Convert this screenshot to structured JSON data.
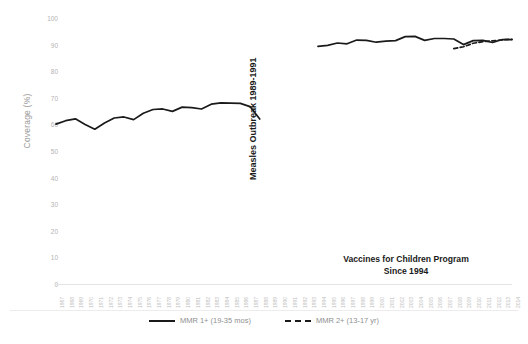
{
  "chart_data": {
    "type": "line",
    "title": "",
    "xlabel": "",
    "ylabel": "Coverage (%)",
    "ylim": [
      0,
      100
    ],
    "ytick_step": 10,
    "yticks": [
      0,
      10,
      20,
      30,
      40,
      50,
      60,
      70,
      80,
      90,
      100
    ],
    "grid": false,
    "legend_position": "bottom-center",
    "x": [
      1967,
      1968,
      1969,
      1970,
      1971,
      1972,
      1973,
      1974,
      1975,
      1976,
      1977,
      1978,
      1979,
      1980,
      1981,
      1982,
      1983,
      1984,
      1985,
      1986,
      1987,
      1988,
      1989,
      1990,
      1991,
      1992,
      1993,
      1994,
      1995,
      1996,
      1997,
      1998,
      1999,
      2000,
      2001,
      2002,
      2003,
      2004,
      2005,
      2006,
      2007,
      2008,
      2009,
      2010,
      2011,
      2012,
      2013,
      2014
    ],
    "series": [
      {
        "name": "MMR 1+ (19-35 mos)",
        "style": "solid",
        "color": "#1a1a1a",
        "values": [
          60.1,
          61.4,
          62.1,
          60.0,
          58.2,
          60.5,
          62.4,
          62.8,
          61.8,
          64.2,
          65.6,
          65.8,
          64.9,
          66.5,
          66.3,
          65.8,
          67.6,
          68.1,
          68.0,
          67.9,
          66.7,
          62.0,
          null,
          null,
          null,
          null,
          null,
          89.3,
          89.7,
          90.6,
          90.3,
          91.7,
          91.6,
          90.9,
          91.3,
          91.5,
          93.0,
          93.1,
          91.6,
          92.3,
          92.3,
          92.1,
          90.0,
          91.5,
          91.6,
          90.8,
          91.9,
          91.9
        ]
      },
      {
        "name": "MMR 2+ (13-17 yr)",
        "style": "dashed",
        "color": "#1a1a1a",
        "values": [
          null,
          null,
          null,
          null,
          null,
          null,
          null,
          null,
          null,
          null,
          null,
          null,
          null,
          null,
          null,
          null,
          null,
          null,
          null,
          null,
          null,
          null,
          null,
          null,
          null,
          null,
          null,
          null,
          null,
          null,
          null,
          null,
          null,
          null,
          null,
          null,
          null,
          null,
          null,
          null,
          null,
          88.5,
          89.2,
          90.5,
          91.1,
          91.4,
          91.8,
          92.0
        ]
      }
    ],
    "annotations": [
      {
        "name": "measles-outbreak",
        "text": "Measles Outbreak 1989-1991",
        "orientation": "vertical"
      },
      {
        "name": "vfc-program",
        "line1": "Vaccines for Children Program",
        "line2": "Since 1994",
        "orientation": "horizontal"
      }
    ],
    "legend": [
      {
        "label": "MMR 1+ (19-35 mos)",
        "style": "solid"
      },
      {
        "label": "MMR 2+ (13-17 yr)",
        "style": "dashed"
      }
    ]
  },
  "colors": {
    "line": "#1a1a1a",
    "axis_text": "#b3b3b3",
    "annotation_text": "#1a1a1a",
    "background": "#ffffff"
  }
}
